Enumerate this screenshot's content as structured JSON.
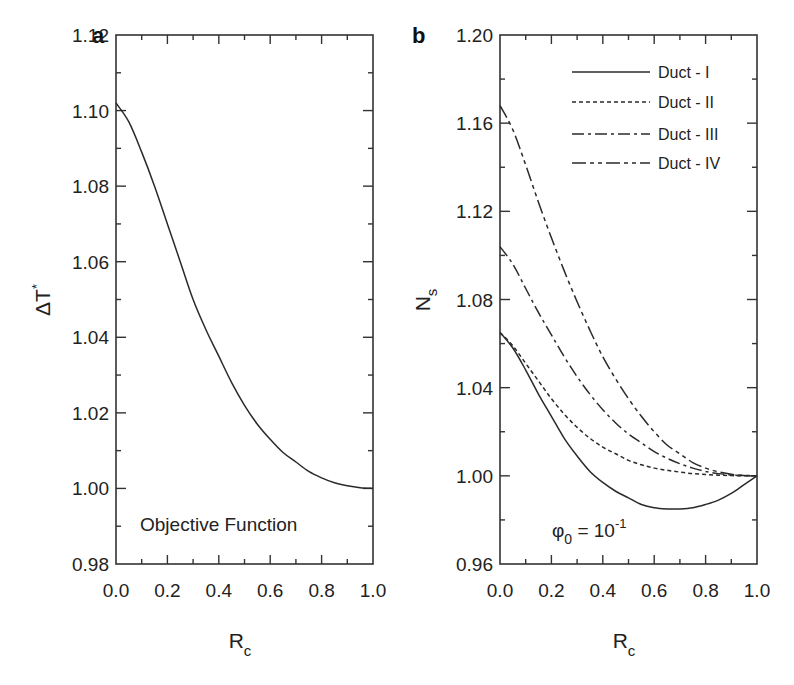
{
  "chart_data": [
    {
      "panel": "a",
      "type": "line",
      "title": "",
      "xlabel": "R_c",
      "ylabel": "ΔT*",
      "xlim": [
        0.0,
        1.0
      ],
      "ylim": [
        0.98,
        1.12
      ],
      "xticks": [
        "0.0",
        "0.2",
        "0.4",
        "0.6",
        "0.8",
        "1.0"
      ],
      "yticks": [
        "0.98",
        "1.00",
        "1.02",
        "1.04",
        "1.06",
        "1.08",
        "1.10",
        "1.12"
      ],
      "grid": false,
      "annotation": "Objective Function",
      "series": [
        {
          "name": "ΔT*",
          "style": "solid",
          "x": [
            0.0,
            0.05,
            0.1,
            0.15,
            0.2,
            0.25,
            0.3,
            0.35,
            0.4,
            0.45,
            0.5,
            0.55,
            0.6,
            0.65,
            0.7,
            0.75,
            0.8,
            0.85,
            0.9,
            0.95,
            1.0
          ],
          "y": [
            1.102,
            1.097,
            1.089,
            1.08,
            1.07,
            1.06,
            1.05,
            1.042,
            1.035,
            1.028,
            1.022,
            1.017,
            1.013,
            1.0095,
            1.007,
            1.0045,
            1.0028,
            1.0015,
            1.0007,
            1.0002,
            1.0
          ]
        }
      ]
    },
    {
      "panel": "b",
      "type": "line",
      "title": "",
      "xlabel": "R_c",
      "ylabel": "N_s",
      "xlim": [
        0.0,
        1.0
      ],
      "ylim": [
        0.96,
        1.2
      ],
      "xticks": [
        "0.0",
        "0.2",
        "0.4",
        "0.6",
        "0.8",
        "1.0"
      ],
      "yticks": [
        "0.96",
        "1.00",
        "1.04",
        "1.08",
        "1.12",
        "1.16",
        "1.20"
      ],
      "grid": false,
      "annotation": "φ0 = 10^-1",
      "legend_position": "upper right",
      "series": [
        {
          "name": "Duct - I",
          "style": "solid",
          "x": [
            0.0,
            0.05,
            0.1,
            0.15,
            0.2,
            0.25,
            0.3,
            0.35,
            0.4,
            0.45,
            0.5,
            0.55,
            0.6,
            0.65,
            0.7,
            0.75,
            0.8,
            0.85,
            0.9,
            0.95,
            1.0
          ],
          "y": [
            1.065,
            1.058,
            1.048,
            1.037,
            1.027,
            1.017,
            1.009,
            1.002,
            0.997,
            0.993,
            0.99,
            0.987,
            0.9855,
            0.985,
            0.985,
            0.9855,
            0.987,
            0.989,
            0.992,
            0.996,
            1.0
          ]
        },
        {
          "name": "Duct - II",
          "style": "dotted",
          "x": [
            0.0,
            0.05,
            0.1,
            0.15,
            0.2,
            0.25,
            0.3,
            0.35,
            0.4,
            0.45,
            0.5,
            0.55,
            0.6,
            0.65,
            0.7,
            0.75,
            0.8,
            0.85,
            0.9,
            0.95,
            1.0
          ],
          "y": [
            1.065,
            1.059,
            1.051,
            1.043,
            1.035,
            1.028,
            1.022,
            1.017,
            1.013,
            1.01,
            1.007,
            1.005,
            1.0035,
            1.0025,
            1.0017,
            1.001,
            1.0006,
            1.0003,
            1.0001,
            1.0,
            1.0
          ]
        },
        {
          "name": "Duct - III",
          "style": "dash-dot",
          "x": [
            0.0,
            0.05,
            0.1,
            0.15,
            0.2,
            0.25,
            0.3,
            0.35,
            0.4,
            0.45,
            0.5,
            0.55,
            0.6,
            0.65,
            0.7,
            0.75,
            0.8,
            0.85,
            0.9,
            0.95,
            1.0
          ],
          "y": [
            1.104,
            1.096,
            1.085,
            1.074,
            1.064,
            1.054,
            1.045,
            1.037,
            1.03,
            1.024,
            1.019,
            1.015,
            1.011,
            1.008,
            1.0055,
            1.0035,
            1.002,
            1.001,
            1.0004,
            1.0001,
            1.0
          ]
        },
        {
          "name": "Duct - IV",
          "style": "dash-dot-dot",
          "x": [
            0.0,
            0.05,
            0.1,
            0.15,
            0.2,
            0.25,
            0.3,
            0.35,
            0.4,
            0.45,
            0.5,
            0.55,
            0.6,
            0.65,
            0.7,
            0.75,
            0.8,
            0.85,
            0.9,
            0.95,
            1.0
          ],
          "y": [
            1.168,
            1.157,
            1.141,
            1.124,
            1.108,
            1.093,
            1.079,
            1.066,
            1.054,
            1.044,
            1.035,
            1.027,
            1.02,
            1.014,
            1.01,
            1.006,
            1.0035,
            1.0018,
            1.0007,
            1.0002,
            1.0
          ]
        }
      ]
    }
  ],
  "panels": {
    "a": {
      "label": "a",
      "ylabel_main": "ΔT",
      "ylabel_sup": "*",
      "xlabel_main": "R",
      "xlabel_sub": "c",
      "annotation": "Objective Function"
    },
    "b": {
      "label": "b",
      "ylabel_main": "N",
      "ylabel_sub": "s",
      "xlabel_main": "R",
      "xlabel_sub": "c",
      "annotation_main": "φ",
      "annotation_sub": "0",
      "annotation_rest": " = 10",
      "annotation_sup": "-1",
      "legend": [
        "Duct - I",
        "Duct - II",
        "Duct - III",
        "Duct - IV"
      ]
    }
  },
  "colors": {
    "line": "#2a2a2a",
    "axis": "#333333",
    "background": "#ffffff"
  }
}
